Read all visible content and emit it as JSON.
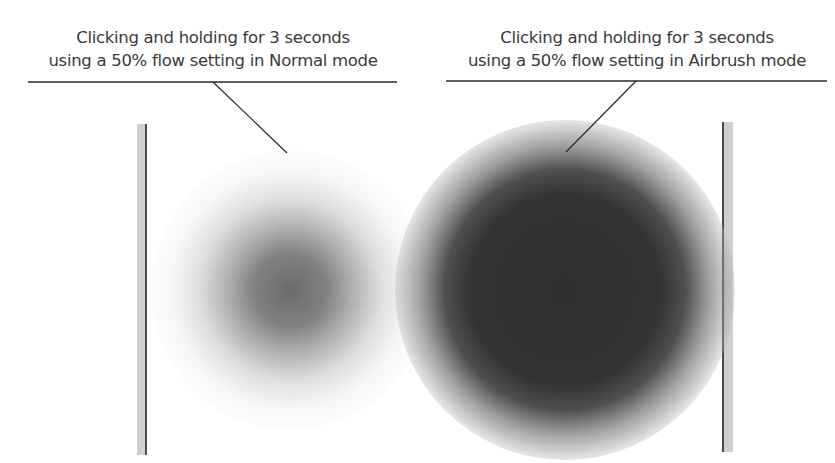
{
  "figure": {
    "left": {
      "caption_line1": "Clicking and holding for 3 seconds",
      "caption_line2": "using a 50% flow setting in Normal mode",
      "mode": "Normal",
      "flow_percent": 50,
      "hold_seconds": 3,
      "spot_description": "soft gray brush spot"
    },
    "right": {
      "caption_line1": "Clicking and holding for 3 seconds",
      "caption_line2": "using a 50% flow setting in Airbrush mode",
      "mode": "Airbrush",
      "flow_percent": 50,
      "hold_seconds": 3,
      "spot_description": "larger, darker brush spot"
    },
    "colors": {
      "text": "#3a3a3a",
      "rule": "#2a2a2a",
      "bar_fill": "#cfcfcf",
      "bar_edge": "#4a4a4a",
      "normal_spot_core": "#5f5f5f",
      "airbrush_spot_core": "#303030"
    }
  }
}
